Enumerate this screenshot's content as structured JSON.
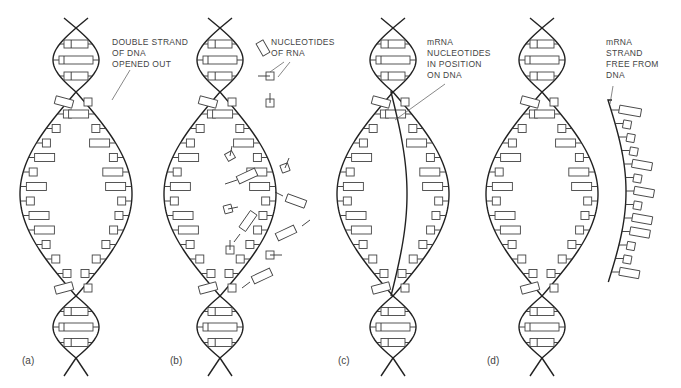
{
  "figure": {
    "panels": [
      {
        "id": "a",
        "letter": "(a)",
        "cx": 76,
        "label": "DOUBLE STRAND\nOF DNA\nOPENED OUT",
        "label_x": 112,
        "label_y": 42
      },
      {
        "id": "b",
        "letter": "(b)",
        "cx": 220,
        "label": "NUCLEOTIDES\nOF RNA",
        "label_x": 270,
        "label_y": 42
      },
      {
        "id": "c",
        "letter": "(c)",
        "cx": 393,
        "label": "mRNA\nNUCLEOTIDES\nIN POSITION\nON DNA",
        "label_x": 427,
        "label_y": 42
      },
      {
        "id": "d",
        "letter": "(d)",
        "cx": 542,
        "label": "mRNA\nSTRAND\nFREE FROM\nDNA",
        "label_x": 606,
        "label_y": 42
      }
    ],
    "letters_y": 363,
    "stroke_color": "#222222",
    "background": "#ffffff"
  }
}
